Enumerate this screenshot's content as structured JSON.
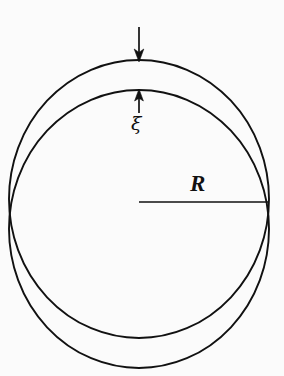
{
  "figure": {
    "background_color": "#fbfbfb",
    "stroke_color": "#111111",
    "width": 284,
    "height": 376,
    "labels": {
      "radius": "R",
      "displacement": "ξ"
    },
    "icons": {
      "load_arrow": "arrow-down-icon",
      "displacement_arrow": "arrow-up-icon"
    },
    "geometry": {
      "outer_circle": {
        "name": "undeformed-circle",
        "cx": 139,
        "cy": 199,
        "rx": 130,
        "ry": 139,
        "stroke_width": 1.9
      },
      "inner_circle": {
        "name": "deformed-circle",
        "cx": 139,
        "cy": 229,
        "rx": 130,
        "ry": 139,
        "stroke_width": 1.9
      },
      "radius_line": {
        "name": "radius-line",
        "x1": 139,
        "y1": 202,
        "x2": 268,
        "y2": 202
      },
      "load_arrow": {
        "x": 139,
        "y_tail": 27,
        "y_tip": 61
      },
      "displacement_arrow": {
        "x": 139,
        "y_tail": 113,
        "y_tip": 90
      }
    }
  }
}
